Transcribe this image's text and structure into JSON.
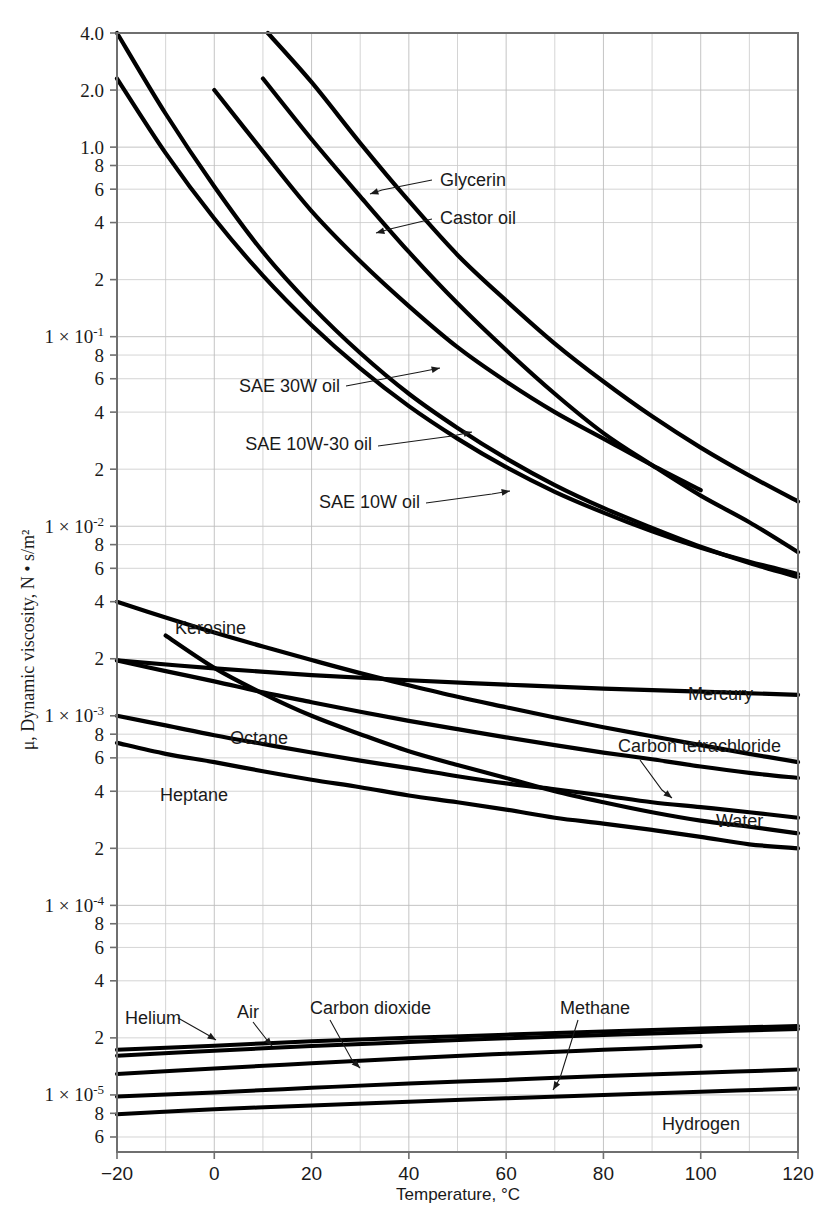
{
  "chart_data": {
    "type": "line",
    "title": "",
    "xlabel": "Temperature, °C",
    "ylabel": "μ, Dynamic viscosity, N • s/m²",
    "xlim": [
      -20,
      120
    ],
    "ylim": [
      5e-06,
      4.0
    ],
    "yscale": "log",
    "xscale": "linear",
    "grid": true,
    "legend_position": "inline-annotations",
    "x_ticks": [
      "-20",
      "0",
      "20",
      "40",
      "60",
      "80",
      "100",
      "120"
    ],
    "x_tick_values": [
      -20,
      0,
      20,
      40,
      60,
      80,
      100,
      120
    ],
    "y_tick_labels": [
      {
        "value": 4.0,
        "text": "4.0"
      },
      {
        "value": 2.0,
        "text": "2.0"
      },
      {
        "value": 1.0,
        "text": "1.0"
      },
      {
        "value": 0.8,
        "text": "8"
      },
      {
        "value": 0.6,
        "text": "6"
      },
      {
        "value": 0.4,
        "text": "4"
      },
      {
        "value": 0.2,
        "text": "2"
      },
      {
        "value": 0.1,
        "text": "1 × 10⁻¹",
        "mantissa": "1 × 10",
        "exponent": "-1"
      },
      {
        "value": 0.08,
        "text": "8"
      },
      {
        "value": 0.06,
        "text": "6"
      },
      {
        "value": 0.04,
        "text": "4"
      },
      {
        "value": 0.02,
        "text": "2"
      },
      {
        "value": 0.01,
        "text": "1 × 10⁻²",
        "mantissa": "1 × 10",
        "exponent": "-2"
      },
      {
        "value": 0.008,
        "text": "8"
      },
      {
        "value": 0.006,
        "text": "6"
      },
      {
        "value": 0.004,
        "text": "4"
      },
      {
        "value": 0.002,
        "text": "2"
      },
      {
        "value": 0.001,
        "text": "1 × 10⁻³",
        "mantissa": "1 × 10",
        "exponent": "-3"
      },
      {
        "value": 0.0008,
        "text": "8"
      },
      {
        "value": 0.0006,
        "text": "6"
      },
      {
        "value": 0.0004,
        "text": "4"
      },
      {
        "value": 0.0002,
        "text": "2"
      },
      {
        "value": 0.0001,
        "text": "1 × 10⁻⁴",
        "mantissa": "1 × 10",
        "exponent": "-4"
      },
      {
        "value": 8e-05,
        "text": "8"
      },
      {
        "value": 6e-05,
        "text": "6"
      },
      {
        "value": 4e-05,
        "text": "4"
      },
      {
        "value": 2e-05,
        "text": "2"
      },
      {
        "value": 1e-05,
        "text": "1 × 10⁻⁵",
        "mantissa": "1 × 10",
        "exponent": "-5"
      },
      {
        "value": 8e-06,
        "text": "8"
      },
      {
        "value": 6e-06,
        "text": "6"
      }
    ],
    "series": [
      {
        "name": "Glycerin",
        "label": "Glycerin",
        "label_anchor": "start",
        "label_x": 440,
        "label_y": 186,
        "leader": [
          [
            432,
            180
          ],
          [
            382,
            190
          ],
          [
            370,
            194
          ]
        ],
        "points": [
          [
            10,
            2.3
          ],
          [
            20,
            1.1
          ],
          [
            30,
            0.55
          ],
          [
            40,
            0.28
          ],
          [
            50,
            0.15
          ],
          [
            60,
            0.085
          ],
          [
            70,
            0.05
          ],
          [
            80,
            0.031
          ],
          [
            90,
            0.021
          ],
          [
            100,
            0.0145
          ],
          [
            110,
            0.0105
          ],
          [
            120,
            0.0073
          ]
        ]
      },
      {
        "name": "Castor oil",
        "label": "Castor oil",
        "label_anchor": "start",
        "label_x": 440,
        "label_y": 224,
        "leader": [
          [
            432,
            219
          ],
          [
            390,
            229
          ],
          [
            376,
            233
          ]
        ],
        "points": [
          [
            11,
            4.0
          ],
          [
            20,
            2.2
          ],
          [
            30,
            1.05
          ],
          [
            40,
            0.52
          ],
          [
            50,
            0.27
          ],
          [
            60,
            0.155
          ],
          [
            70,
            0.092
          ],
          [
            80,
            0.058
          ],
          [
            90,
            0.038
          ],
          [
            100,
            0.026
          ],
          [
            110,
            0.0185
          ],
          [
            120,
            0.0135
          ]
        ]
      },
      {
        "name": "SAE 30W oil",
        "label": "SAE 30W oil",
        "label_anchor": "end",
        "label_x": 340,
        "label_y": 392,
        "leader": [
          [
            346,
            386
          ],
          [
            420,
            372
          ],
          [
            440,
            368
          ]
        ],
        "points": [
          [
            0,
            2.0
          ],
          [
            10,
            0.95
          ],
          [
            20,
            0.46
          ],
          [
            30,
            0.25
          ],
          [
            40,
            0.145
          ],
          [
            50,
            0.088
          ],
          [
            60,
            0.058
          ],
          [
            70,
            0.04
          ],
          [
            80,
            0.029
          ],
          [
            90,
            0.021
          ],
          [
            100,
            0.0155
          ]
        ]
      },
      {
        "name": "SAE 10W-30 oil",
        "label": "SAE 10W-30 oil",
        "label_anchor": "end",
        "label_x": 372,
        "label_y": 450,
        "leader": [
          [
            378,
            446
          ],
          [
            452,
            436
          ],
          [
            472,
            432
          ]
        ],
        "points": [
          [
            -20,
            2.3
          ],
          [
            -10,
            0.93
          ],
          [
            0,
            0.42
          ],
          [
            10,
            0.21
          ],
          [
            20,
            0.115
          ],
          [
            30,
            0.068
          ],
          [
            40,
            0.043
          ],
          [
            50,
            0.029
          ],
          [
            60,
            0.0205
          ],
          [
            70,
            0.0152
          ],
          [
            80,
            0.0118
          ],
          [
            90,
            0.0094
          ],
          [
            100,
            0.0077
          ],
          [
            110,
            0.0065
          ],
          [
            120,
            0.0056
          ]
        ]
      },
      {
        "name": "SAE 10W oil",
        "label": "SAE 10W oil",
        "label_anchor": "end",
        "label_x": 420,
        "label_y": 508,
        "leader": [
          [
            426,
            503
          ],
          [
            492,
            494
          ],
          [
            510,
            491
          ]
        ],
        "points": [
          [
            -20,
            4.0
          ],
          [
            -10,
            1.5
          ],
          [
            0,
            0.62
          ],
          [
            10,
            0.28
          ],
          [
            20,
            0.145
          ],
          [
            30,
            0.082
          ],
          [
            40,
            0.05
          ],
          [
            50,
            0.033
          ],
          [
            60,
            0.0228
          ],
          [
            70,
            0.0165
          ],
          [
            80,
            0.0125
          ],
          [
            90,
            0.0098
          ],
          [
            100,
            0.0078
          ],
          [
            110,
            0.0064
          ],
          [
            120,
            0.0054
          ]
        ]
      },
      {
        "name": "Kerosine",
        "label": "Kerosine",
        "label_anchor": "start",
        "label_x": 175,
        "label_y": 634,
        "leader": [],
        "points": [
          [
            -20,
            0.004
          ],
          [
            -10,
            0.0033
          ],
          [
            0,
            0.00275
          ],
          [
            10,
            0.00232
          ],
          [
            20,
            0.00197
          ],
          [
            30,
            0.00168
          ],
          [
            40,
            0.00145
          ],
          [
            50,
            0.00126
          ],
          [
            60,
            0.00111
          ],
          [
            70,
            0.00098
          ],
          [
            80,
            0.00087
          ],
          [
            90,
            0.00078
          ],
          [
            100,
            0.0007
          ],
          [
            110,
            0.00063
          ],
          [
            120,
            0.00057
          ]
        ]
      },
      {
        "name": "Mercury",
        "label": "Mercury",
        "label_anchor": "start",
        "label_x": 688,
        "label_y": 700,
        "leader": [],
        "points": [
          [
            -20,
            0.00196
          ],
          [
            0,
            0.00178
          ],
          [
            20,
            0.00164
          ],
          [
            40,
            0.00154
          ],
          [
            60,
            0.00146
          ],
          [
            80,
            0.00139
          ],
          [
            100,
            0.00134
          ],
          [
            120,
            0.00129
          ]
        ]
      },
      {
        "name": "Carbon tetrachloride",
        "label": "Carbon tetrachloride",
        "label_anchor": "start",
        "label_x": 618,
        "label_y": 752,
        "leader": [
          [
            640,
            760
          ],
          [
            662,
            790
          ],
          [
            672,
            798
          ]
        ],
        "points": [
          [
            -20,
            0.00196
          ],
          [
            -10,
            0.00172
          ],
          [
            0,
            0.00152
          ],
          [
            10,
            0.00133
          ],
          [
            20,
            0.00118
          ],
          [
            30,
            0.00105
          ],
          [
            40,
            0.00094
          ],
          [
            50,
            0.00085
          ],
          [
            60,
            0.00077
          ],
          [
            70,
            0.0007
          ],
          [
            80,
            0.00064
          ],
          [
            90,
            0.00059
          ],
          [
            100,
            0.00054
          ],
          [
            110,
            0.0005
          ],
          [
            120,
            0.00047
          ]
        ]
      },
      {
        "name": "Octane",
        "label": "Octane",
        "label_anchor": "start",
        "label_x": 230,
        "label_y": 744,
        "leader": [],
        "points": [
          [
            -20,
            0.001
          ],
          [
            -10,
            0.00089
          ],
          [
            0,
            0.00079
          ],
          [
            10,
            0.00071
          ],
          [
            20,
            0.00064
          ],
          [
            30,
            0.00058
          ],
          [
            40,
            0.00053
          ],
          [
            50,
            0.00048
          ],
          [
            60,
            0.00044
          ],
          [
            70,
            0.00041
          ],
          [
            80,
            0.00038
          ],
          [
            90,
            0.00035
          ],
          [
            100,
            0.00033
          ],
          [
            110,
            0.00031
          ],
          [
            120,
            0.00029
          ]
        ]
      },
      {
        "name": "Water",
        "label": "Water",
        "label_anchor": "start",
        "label_x": 716,
        "label_y": 827,
        "leader": [],
        "points": [
          [
            -10,
            0.00265
          ],
          [
            0,
            0.00179
          ],
          [
            10,
            0.00131
          ],
          [
            20,
            0.001
          ],
          [
            30,
            0.0008
          ],
          [
            40,
            0.00065
          ],
          [
            50,
            0.00055
          ],
          [
            60,
            0.00047
          ],
          [
            70,
            0.0004
          ],
          [
            80,
            0.00035
          ],
          [
            90,
            0.00031
          ],
          [
            100,
            0.00028
          ],
          [
            110,
            0.00026
          ],
          [
            120,
            0.00024
          ]
        ]
      },
      {
        "name": "Heptane",
        "label": "Heptane",
        "label_anchor": "start",
        "label_x": 160,
        "label_y": 801,
        "leader": [],
        "points": [
          [
            -20,
            0.00072
          ],
          [
            -10,
            0.00063
          ],
          [
            0,
            0.00057
          ],
          [
            10,
            0.00051
          ],
          [
            20,
            0.00046
          ],
          [
            30,
            0.00042
          ],
          [
            40,
            0.00038
          ],
          [
            50,
            0.00035
          ],
          [
            60,
            0.00032
          ],
          [
            70,
            0.00029
          ],
          [
            80,
            0.00027
          ],
          [
            90,
            0.00025
          ],
          [
            100,
            0.00023
          ],
          [
            110,
            0.00021
          ],
          [
            120,
            0.0002
          ]
        ]
      },
      {
        "name": "Helium",
        "label": "Helium",
        "label_anchor": "start",
        "label_x": 125,
        "label_y": 1024,
        "leader": [
          [
            178,
            1018
          ],
          [
            208,
            1035
          ],
          [
            216,
            1040
          ]
        ],
        "points": [
          [
            -20,
            1.73e-05
          ],
          [
            0,
            1.82e-05
          ],
          [
            20,
            1.92e-05
          ],
          [
            40,
            2e-05
          ],
          [
            60,
            2.08e-05
          ],
          [
            80,
            2.16e-05
          ],
          [
            100,
            2.24e-05
          ],
          [
            120,
            2.31e-05
          ]
        ]
      },
      {
        "name": "Air",
        "label": "Air",
        "label_anchor": "start",
        "label_x": 237,
        "label_y": 1018,
        "leader": [
          [
            253,
            1022
          ],
          [
            267,
            1040
          ],
          [
            272,
            1046
          ]
        ],
        "points": [
          [
            -20,
            1.61e-05
          ],
          [
            0,
            1.71e-05
          ],
          [
            20,
            1.81e-05
          ],
          [
            40,
            1.9e-05
          ],
          [
            60,
            1.99e-05
          ],
          [
            80,
            2.07e-05
          ],
          [
            100,
            2.15e-05
          ],
          [
            120,
            2.23e-05
          ]
        ]
      },
      {
        "name": "Carbon dioxide",
        "label": "Carbon dioxide",
        "label_anchor": "start",
        "label_x": 310,
        "label_y": 1014,
        "leader": [
          [
            330,
            1020
          ],
          [
            352,
            1060
          ],
          [
            360,
            1068
          ]
        ],
        "points": [
          [
            -20,
            1.29e-05
          ],
          [
            0,
            1.38e-05
          ],
          [
            20,
            1.47e-05
          ],
          [
            40,
            1.56e-05
          ],
          [
            60,
            1.65e-05
          ],
          [
            80,
            1.73e-05
          ],
          [
            100,
            1.81e-05
          ]
        ]
      },
      {
        "name": "Methane",
        "label": "Methane",
        "label_anchor": "start",
        "label_x": 560,
        "label_y": 1014,
        "leader": [
          [
            578,
            1020
          ],
          [
            560,
            1078
          ],
          [
            553,
            1090
          ]
        ],
        "points": [
          [
            -20,
            9.8e-06
          ],
          [
            0,
            1.03e-05
          ],
          [
            20,
            1.09e-05
          ],
          [
            40,
            1.15e-05
          ],
          [
            60,
            1.2e-05
          ],
          [
            80,
            1.26e-05
          ],
          [
            100,
            1.31e-05
          ],
          [
            120,
            1.36e-05
          ]
        ]
      },
      {
        "name": "Hydrogen",
        "label": "Hydrogen",
        "label_anchor": "start",
        "label_x": 662,
        "label_y": 1130,
        "leader": [],
        "points": [
          [
            -20,
            7.9e-06
          ],
          [
            0,
            8.4e-06
          ],
          [
            20,
            8.8e-06
          ],
          [
            40,
            9.2e-06
          ],
          [
            60,
            9.6e-06
          ],
          [
            80,
            1e-05
          ],
          [
            100,
            1.04e-05
          ],
          [
            120,
            1.08e-05
          ]
        ]
      }
    ]
  }
}
